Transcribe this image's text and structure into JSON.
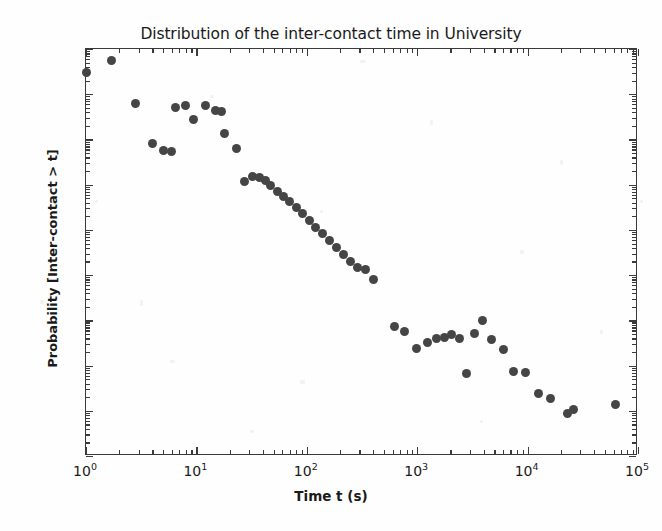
{
  "figure": {
    "title": "Distribution of the inter-contact time in University",
    "xaxis_title": "Time t (s)",
    "yaxis_title": "Probability [Inter-contact > t]",
    "marker_color": "#454545",
    "axis_color": "#3a3a3a",
    "background_color": "#fefefe"
  },
  "xtick_labels": [
    {
      "mant": "10",
      "exp": "0"
    },
    {
      "mant": "10",
      "exp": "1"
    },
    {
      "mant": "10",
      "exp": "2"
    },
    {
      "mant": "10",
      "exp": "3"
    },
    {
      "mant": "10",
      "exp": "4"
    },
    {
      "mant": "10",
      "exp": "5"
    }
  ],
  "ytick_labels": [
    {
      "mant": "10",
      "exp": "0"
    },
    {
      "mant": "10",
      "exp": "-1"
    },
    {
      "mant": "10",
      "exp": "-2"
    },
    {
      "mant": "10",
      "exp": "-3"
    },
    {
      "mant": "10",
      "exp": "-4"
    },
    {
      "mant": "10",
      "exp": "-5"
    },
    {
      "mant": "10",
      "exp": "-6"
    },
    {
      "mant": "10",
      "exp": "-7"
    },
    {
      "mant": "10",
      "exp": "-8"
    },
    {
      "mant": "10",
      "exp": "-9"
    }
  ],
  "chart_data": {
    "type": "scatter",
    "title": "Distribution of the inter-contact time in University",
    "xlabel": "Time t (s)",
    "ylabel": "Probability [Inter-contact > t]",
    "xscale": "log",
    "yscale": "log",
    "xlim": [
      1,
      100000
    ],
    "ylim": [
      1e-09,
      1
    ],
    "grid": false,
    "legend": null,
    "series": [
      {
        "name": "inter-contact time CCDF",
        "marker": "circle",
        "color": "#454545",
        "x": [
          1.0,
          1.7,
          2.8,
          4.0,
          5.0,
          6.0,
          6.5,
          8.0,
          9.5,
          12.0,
          15.0,
          17.0,
          18.0,
          23.0,
          27.0,
          32.0,
          37.0,
          42.0,
          47.0,
          54.0,
          62.0,
          70.0,
          80.0,
          92.0,
          105.0,
          120.0,
          140.0,
          160.0,
          185.0,
          215.0,
          250.0,
          290.0,
          340.0,
          400.0,
          620.0,
          760.0,
          980.0,
          1250.0,
          1500.0,
          1750.0,
          2050.0,
          2400.0,
          2800.0,
          3300.0,
          3900.0,
          4700.0,
          6000.0,
          7500.0,
          9500.0,
          12500.0,
          16000.0,
          23000.0,
          26000.0,
          62000.0
        ],
        "y": [
          0.3,
          0.55,
          0.062,
          0.0083,
          0.0057,
          0.0054,
          0.052,
          0.056,
          0.028,
          0.055,
          0.044,
          0.041,
          0.0135,
          0.0062,
          0.00115,
          0.00155,
          0.00145,
          0.00125,
          0.00098,
          0.00072,
          0.00055,
          0.00042,
          0.00031,
          0.00023,
          0.000165,
          0.000115,
          8.2e-05,
          5.7e-05,
          4e-05,
          2.8e-05,
          1.95e-05,
          1.45e-05,
          1.35e-05,
          8.2e-06,
          7.2e-07,
          5.8e-07,
          2.4e-07,
          3.3e-07,
          4e-07,
          4.2e-07,
          4.8e-07,
          4e-07,
          6.8e-08,
          5e-07,
          9.8e-07,
          3.8e-07,
          2.3e-07,
          7.5e-08,
          7.2e-08,
          2.4e-08,
          1.9e-08,
          8.8e-09,
          1.05e-08,
          1.38e-08
        ]
      }
    ]
  }
}
